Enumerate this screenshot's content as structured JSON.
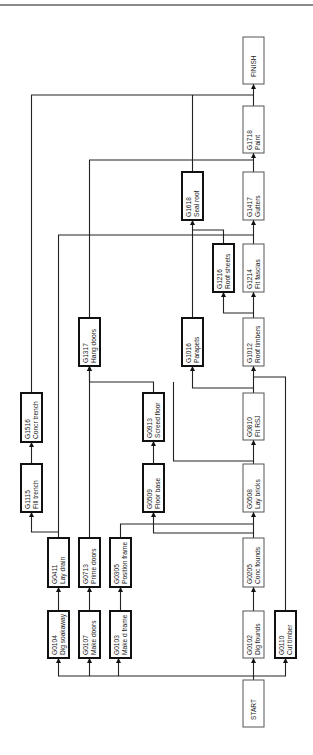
{
  "diagram": {
    "type": "activity-on-node network",
    "orientation": "rotated 90deg counterclockwise (flow bottom-to-top)",
    "colors": {
      "line": "#222222",
      "critical_border": "#555555",
      "noncritical_border": "#111111",
      "top_rule": "#8a8a8a"
    },
    "nodes": [
      {
        "id": "START",
        "code": "START",
        "label": "",
        "x": 243,
        "y": 680,
        "w": 21,
        "h": 47,
        "critical": true
      },
      {
        "id": "G0104",
        "code": "G0104",
        "label": "Dig soakaway",
        "x": 48,
        "y": 611,
        "w": 21,
        "h": 47,
        "critical": false
      },
      {
        "id": "G0107",
        "code": "G0107",
        "label": "Make doors",
        "x": 79,
        "y": 611,
        "w": 21,
        "h": 47,
        "critical": false
      },
      {
        "id": "G0103",
        "code": "G0103",
        "label": "Make d frame",
        "x": 110,
        "y": 611,
        "w": 21,
        "h": 47,
        "critical": false
      },
      {
        "id": "G0102",
        "code": "G0102",
        "label": "Dig founds",
        "x": 243,
        "y": 611,
        "w": 21,
        "h": 47,
        "critical": true
      },
      {
        "id": "G0110",
        "code": "G0110",
        "label": "Cut timber",
        "x": 275,
        "y": 611,
        "w": 21,
        "h": 47,
        "critical": false
      },
      {
        "id": "G0411",
        "code": "G0411",
        "label": "Lay drain",
        "x": 48,
        "y": 538,
        "w": 21,
        "h": 49,
        "critical": false
      },
      {
        "id": "G0713",
        "code": "G0713",
        "label": "Prime doors",
        "x": 79,
        "y": 538,
        "w": 21,
        "h": 49,
        "critical": false
      },
      {
        "id": "G0305",
        "code": "G0305",
        "label": "Position frame",
        "x": 110,
        "y": 538,
        "w": 21,
        "h": 49,
        "critical": false
      },
      {
        "id": "G0205",
        "code": "G0205",
        "label": "Conc founds",
        "x": 243,
        "y": 538,
        "w": 21,
        "h": 49,
        "critical": true
      },
      {
        "id": "G1115",
        "code": "G1115",
        "label": "Fill trench",
        "x": 21,
        "y": 464,
        "w": 21,
        "h": 48,
        "critical": false
      },
      {
        "id": "G0509",
        "code": "G0509",
        "label": "Floor base",
        "x": 143,
        "y": 464,
        "w": 21,
        "h": 48,
        "critical": false
      },
      {
        "id": "G0508",
        "code": "G0508",
        "label": "Lay bricks",
        "x": 243,
        "y": 464,
        "w": 21,
        "h": 48,
        "critical": true
      },
      {
        "id": "G1516",
        "code": "G1516",
        "label": "Concr trench",
        "x": 21,
        "y": 393,
        "w": 21,
        "h": 49,
        "critical": false
      },
      {
        "id": "G0913",
        "code": "G0913",
        "label": "Screed floor",
        "x": 143,
        "y": 393,
        "w": 21,
        "h": 48,
        "critical": false
      },
      {
        "id": "G0810",
        "code": "G0810",
        "label": "Fit RSJ",
        "x": 243,
        "y": 393,
        "w": 21,
        "h": 47,
        "critical": true
      },
      {
        "id": "G1317",
        "code": "G1317",
        "label": "Hang doors",
        "x": 79,
        "y": 318,
        "w": 21,
        "h": 48,
        "critical": false
      },
      {
        "id": "G1016",
        "code": "G1016",
        "label": "Parapets",
        "x": 182,
        "y": 318,
        "w": 21,
        "h": 48,
        "critical": false
      },
      {
        "id": "G1012",
        "code": "G1012",
        "label": "Roof timbers",
        "x": 243,
        "y": 318,
        "w": 21,
        "h": 48,
        "critical": true
      },
      {
        "id": "G1216",
        "code": "G1216",
        "label": "Roof sheets",
        "x": 213,
        "y": 244,
        "w": 21,
        "h": 48,
        "critical": false
      },
      {
        "id": "G1214",
        "code": "G1214",
        "label": "Fit fascias",
        "x": 243,
        "y": 244,
        "w": 21,
        "h": 48,
        "critical": true
      },
      {
        "id": "G1618",
        "code": "G1618",
        "label": "Seal roof",
        "x": 182,
        "y": 172,
        "w": 21,
        "h": 48,
        "critical": false
      },
      {
        "id": "G1417",
        "code": "G1417",
        "label": "Gutters",
        "x": 243,
        "y": 172,
        "w": 21,
        "h": 48,
        "critical": true
      },
      {
        "id": "G1718",
        "code": "G1718",
        "label": "Paint",
        "x": 243,
        "y": 106,
        "w": 21,
        "h": 47,
        "critical": true
      },
      {
        "id": "FINISH",
        "code": "FINISH",
        "label": "",
        "x": 243,
        "y": 37,
        "w": 21,
        "h": 47,
        "critical": true
      }
    ],
    "edges": [
      {
        "from": "START",
        "to": "G0102",
        "points": [
          [
            253.5,
            680
          ],
          [
            253.5,
            658
          ]
        ]
      },
      {
        "from": "START",
        "to": "G0104",
        "points": [
          [
            253.5,
            676
          ],
          [
            58.5,
            676
          ],
          [
            58.5,
            658
          ]
        ]
      },
      {
        "from": "START",
        "to": "G0107",
        "points": [
          [
            89.5,
            676
          ],
          [
            89.5,
            658
          ]
        ]
      },
      {
        "from": "START",
        "to": "G0103",
        "points": [
          [
            118.5,
            676
          ],
          [
            118.5,
            658
          ]
        ]
      },
      {
        "from": "START",
        "to": "G0110",
        "points": [
          [
            253.5,
            676
          ],
          [
            285.5,
            676
          ],
          [
            285.5,
            658
          ]
        ]
      },
      {
        "from": "G0104",
        "to": "G0411",
        "points": [
          [
            58.5,
            611
          ],
          [
            58.5,
            587
          ]
        ]
      },
      {
        "from": "G0107",
        "to": "G0713",
        "points": [
          [
            89.5,
            611
          ],
          [
            89.5,
            587
          ]
        ]
      },
      {
        "from": "G0103",
        "to": "G0305",
        "points": [
          [
            120.5,
            611
          ],
          [
            120.5,
            587
          ]
        ]
      },
      {
        "from": "G0102",
        "to": "G0205",
        "points": [
          [
            253.5,
            611
          ],
          [
            253.5,
            587
          ]
        ]
      },
      {
        "from": "G0411",
        "to": "G1115",
        "points": [
          [
            58.5,
            538
          ],
          [
            58.5,
            532
          ],
          [
            31.5,
            532
          ],
          [
            31.5,
            512
          ]
        ]
      },
      {
        "from": "G0205",
        "to": "G0508",
        "points": [
          [
            253.5,
            538
          ],
          [
            253.5,
            512
          ]
        ]
      },
      {
        "from": "G0205",
        "to": "G0509",
        "points": [
          [
            253.5,
            533
          ],
          [
            153.5,
            533
          ],
          [
            153.5,
            512
          ]
        ]
      },
      {
        "from": "G0305",
        "to": "G0508",
        "points": [
          [
            120.5,
            538
          ],
          [
            120.5,
            524
          ],
          [
            253.5,
            524
          ]
        ]
      },
      {
        "from": "G1115",
        "to": "G1516",
        "points": [
          [
            31.5,
            464
          ],
          [
            31.5,
            442
          ]
        ]
      },
      {
        "from": "G0509",
        "to": "G0913",
        "points": [
          [
            153.5,
            464
          ],
          [
            153.5,
            441
          ]
        ]
      },
      {
        "from": "G0508",
        "to": "G0810",
        "points": [
          [
            253.5,
            464
          ],
          [
            253.5,
            440
          ]
        ]
      },
      {
        "from": "G0508",
        "to": "G1317",
        "points": [
          [
            253.5,
            461
          ],
          [
            173.5,
            461
          ],
          [
            173.5,
            382
          ]
        ]
      },
      {
        "from": "G0913",
        "to": "G1317",
        "points": [
          [
            153.5,
            393
          ],
          [
            153.5,
            382
          ],
          [
            89.5,
            382
          ],
          [
            89.5,
            366
          ]
        ]
      },
      {
        "from": "G0713",
        "to": "G1317",
        "points": [
          [
            89.5,
            538
          ],
          [
            89.5,
            366
          ]
        ]
      },
      {
        "from": "G0810",
        "to": "G1012",
        "points": [
          [
            253.5,
            393
          ],
          [
            253.5,
            366
          ]
        ]
      },
      {
        "from": "G0810",
        "to": "G1016",
        "points": [
          [
            253.5,
            388
          ],
          [
            192.5,
            388
          ],
          [
            192.5,
            366
          ]
        ]
      },
      {
        "from": "G0110",
        "to": "G1012",
        "points": [
          [
            285.5,
            611
          ],
          [
            285.5,
            377
          ],
          [
            253.5,
            377
          ]
        ]
      },
      {
        "from": "G1012",
        "to": "G1214",
        "points": [
          [
            253.5,
            318
          ],
          [
            253.5,
            292
          ]
        ]
      },
      {
        "from": "G1012",
        "to": "G1216",
        "points": [
          [
            253.5,
            313
          ],
          [
            223.5,
            313
          ],
          [
            223.5,
            292
          ]
        ]
      },
      {
        "from": "G1016",
        "to": "G1618",
        "points": [
          [
            192.5,
            318
          ],
          [
            192.5,
            220
          ]
        ]
      },
      {
        "from": "G1216",
        "to": "G1618",
        "points": [
          [
            223.5,
            244
          ],
          [
            223.5,
            230
          ],
          [
            192.5,
            230
          ]
        ]
      },
      {
        "from": "G1214",
        "to": "G1417",
        "points": [
          [
            253.5,
            244
          ],
          [
            253.5,
            220
          ]
        ]
      },
      {
        "from": "G0411",
        "to": "G1417",
        "points": [
          [
            58.5,
            532
          ],
          [
            58.5,
            235
          ],
          [
            253.5,
            235
          ]
        ]
      },
      {
        "from": "G1417",
        "to": "G1718",
        "points": [
          [
            253.5,
            172
          ],
          [
            253.5,
            153
          ]
        ]
      },
      {
        "from": "G1317",
        "to": "G1718",
        "points": [
          [
            89.5,
            318
          ],
          [
            89.5,
            160
          ],
          [
            253.5,
            160
          ]
        ]
      },
      {
        "from": "G1718",
        "to": "FINISH",
        "points": [
          [
            253.5,
            106
          ],
          [
            253.5,
            84
          ]
        ]
      },
      {
        "from": "G1618",
        "to": "FINISH",
        "points": [
          [
            192.5,
            172
          ],
          [
            192.5,
            95
          ]
        ]
      },
      {
        "from": "G1516",
        "to": "FINISH",
        "points": [
          [
            31.5,
            393
          ],
          [
            31.5,
            95
          ],
          [
            253.5,
            95
          ]
        ]
      }
    ]
  }
}
